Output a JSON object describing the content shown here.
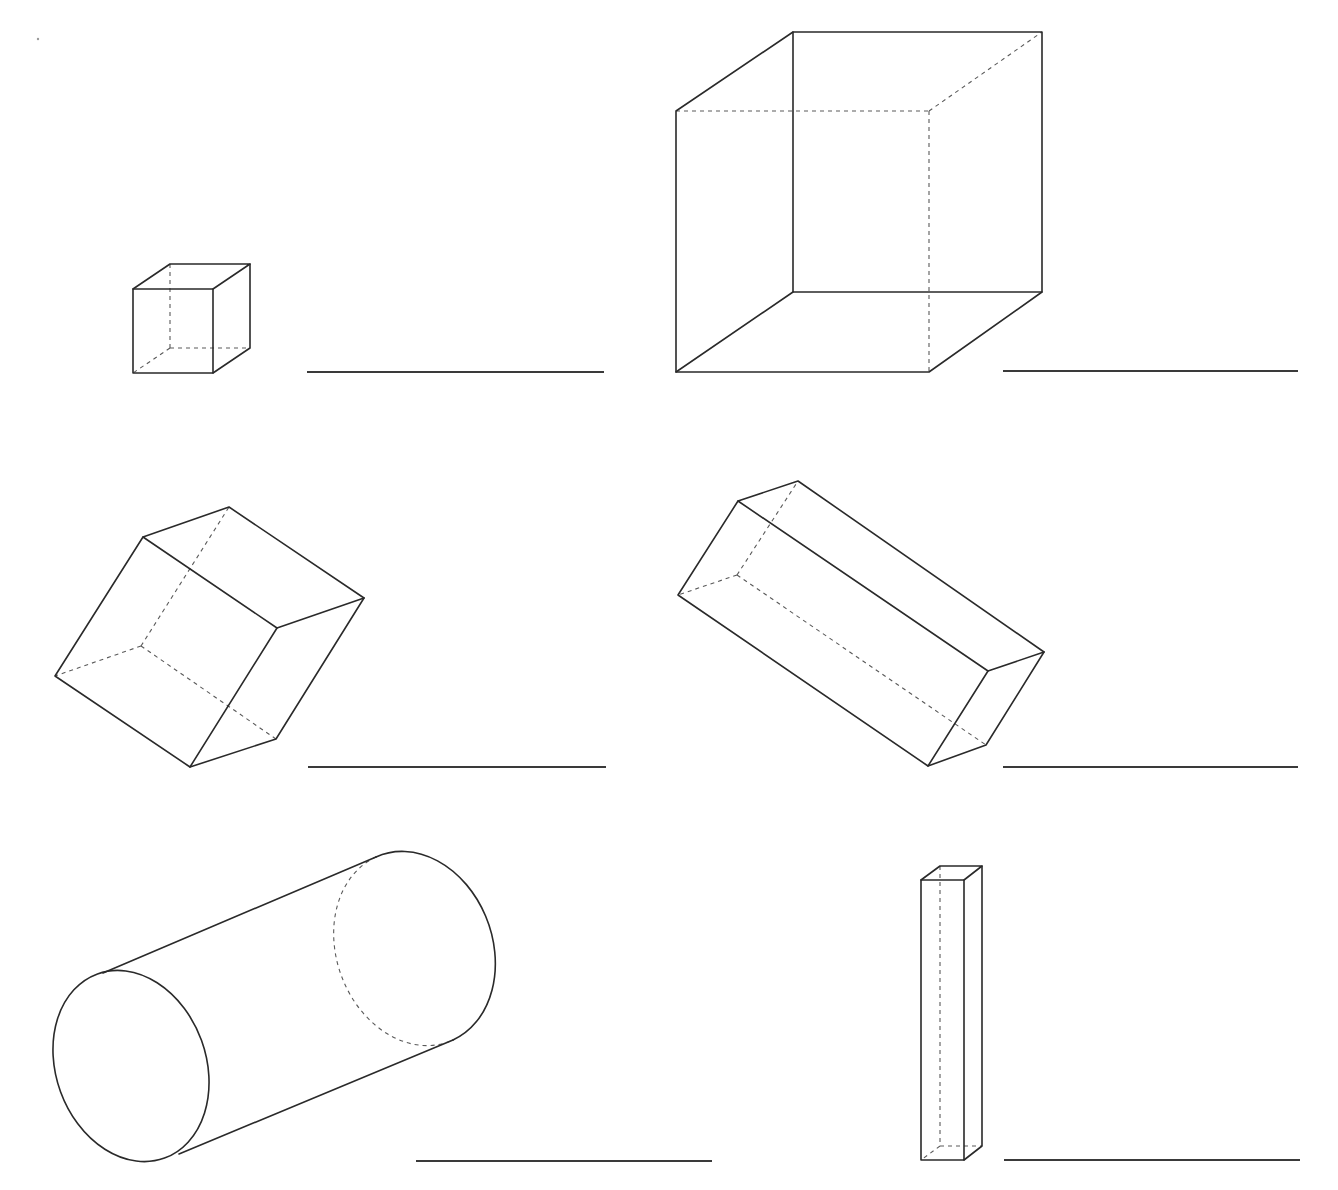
{
  "worksheet": {
    "title": "Identify the 3D shapes",
    "shapes": [
      {
        "id": 1,
        "name": "small cube",
        "answer": ""
      },
      {
        "id": 2,
        "name": "large cube",
        "answer": ""
      },
      {
        "id": 3,
        "name": "tilted cube",
        "answer": ""
      },
      {
        "id": 4,
        "name": "tilted rectangular prism",
        "answer": ""
      },
      {
        "id": 5,
        "name": "cylinder",
        "answer": ""
      },
      {
        "id": 6,
        "name": "tall rectangular prism",
        "answer": ""
      }
    ]
  },
  "colors": {
    "line": "#2a2a2a",
    "hidden": "#5a5a5a",
    "background": "#ffffff"
  }
}
